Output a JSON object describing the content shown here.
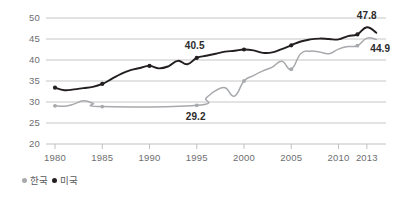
{
  "chart_data": {
    "type": "line",
    "title": "",
    "subtitle": "",
    "xlabel": "",
    "ylabel": "",
    "xlim": [
      1979,
      2015
    ],
    "ylim": [
      20,
      50
    ],
    "grid": true,
    "legend_position": "bottom-left",
    "x_ticks": [
      "1980",
      "1985",
      "1990",
      "1995",
      "2000",
      "2005",
      "2010",
      "2013"
    ],
    "x_tick_values": [
      1980,
      1985,
      1990,
      1995,
      2000,
      2005,
      2010,
      2013
    ],
    "y_ticks": [
      "20",
      "25",
      "30",
      "35",
      "40",
      "45",
      "50"
    ],
    "y_tick_values": [
      20,
      25,
      30,
      35,
      40,
      45,
      50
    ],
    "series": [
      {
        "name": "미국",
        "color": "#231f20",
        "marker_years": [
          1980,
          1985,
          1990,
          1995,
          2000,
          2005,
          2012
        ],
        "x": [
          1980,
          1981,
          1982,
          1983,
          1984,
          1985,
          1986,
          1987,
          1988,
          1989,
          1990,
          1991,
          1992,
          1993,
          1994,
          1995,
          1996,
          1997,
          1998,
          1999,
          2000,
          2001,
          2002,
          2003,
          2004,
          2005,
          2006,
          2007,
          2008,
          2009,
          2010,
          2011,
          2012,
          2013,
          2014
        ],
        "values": [
          33.4,
          32.8,
          33.0,
          33.3,
          33.6,
          34.3,
          35.5,
          36.7,
          37.6,
          38.1,
          38.6,
          38.0,
          38.5,
          39.8,
          39.0,
          40.5,
          41.0,
          41.5,
          42.0,
          42.2,
          42.5,
          42.3,
          41.7,
          41.8,
          42.6,
          43.5,
          44.4,
          44.9,
          45.1,
          45.0,
          44.9,
          45.7,
          46.1,
          47.8,
          46.5
        ]
      },
      {
        "name": "한국",
        "color": "#a7a9ac",
        "marker_years": [
          1980,
          1985,
          1995,
          2000,
          2005,
          2012
        ],
        "x": [
          1980,
          1981,
          1982,
          1983,
          1984,
          1985,
          1995,
          1996,
          1997,
          1998,
          1999,
          2000,
          2001,
          2002,
          2003,
          2004,
          2005,
          2006,
          2007,
          2008,
          2009,
          2010,
          2011,
          2012,
          2013,
          2014
        ],
        "values": [
          29.1,
          29.0,
          29.5,
          30.3,
          29.7,
          28.9,
          29.2,
          31.0,
          32.7,
          33.4,
          31.4,
          35.0,
          36.3,
          37.4,
          38.3,
          39.7,
          37.8,
          41.5,
          42.1,
          41.9,
          41.5,
          42.6,
          43.2,
          43.4,
          45.2,
          44.9
        ]
      }
    ],
    "annotations": [
      {
        "label": "40.5",
        "x": 1995,
        "y": 40.5,
        "series": "미국"
      },
      {
        "label": "47.8",
        "x": 2013,
        "y": 47.8,
        "series": "미국"
      },
      {
        "label": "29.2",
        "x": 1995,
        "y": 29.2,
        "series": "한국"
      },
      {
        "label": "44.9",
        "x": 2014,
        "y": 44.9,
        "series": "한국"
      }
    ]
  },
  "legend": {
    "items": [
      {
        "label": "한국",
        "color": "#a7a9ac"
      },
      {
        "label": "미국",
        "color": "#231f20"
      }
    ]
  }
}
